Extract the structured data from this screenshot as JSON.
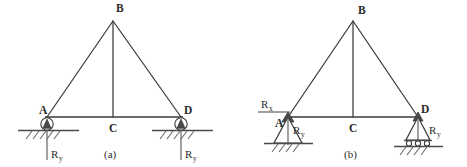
{
  "figure": {
    "background_color": "#ffffff",
    "line_color": "#3a3a3a",
    "ground_color": "#4a4a4a"
  },
  "panels": [
    {
      "id": "a",
      "caption": "(a)",
      "nodes": [
        {
          "key": "A",
          "label": "A",
          "x": 47,
          "y": 117
        },
        {
          "key": "B",
          "label": "B",
          "x": 113,
          "y": 20
        },
        {
          "key": "C",
          "label": "C",
          "x": 113,
          "y": 117
        },
        {
          "key": "D",
          "label": "D",
          "x": 181,
          "y": 117
        }
      ],
      "members": [
        {
          "from": "A",
          "to": "B"
        },
        {
          "from": "B",
          "to": "D"
        },
        {
          "from": "B",
          "to": "C"
        },
        {
          "from": "A",
          "to": "D"
        }
      ],
      "supports": [
        {
          "at": "A",
          "type": "roller-circle",
          "ground": true
        },
        {
          "at": "D",
          "type": "roller-circle",
          "ground": true
        }
      ],
      "reactions": [
        {
          "label": "R",
          "subscript": "y",
          "at": "A",
          "direction": "vertical"
        },
        {
          "label": "R",
          "subscript": "y",
          "at": "D",
          "direction": "vertical"
        }
      ]
    },
    {
      "id": "b",
      "caption": "(b)",
      "nodes": [
        {
          "key": "A",
          "label": "A",
          "x": 288,
          "y": 117
        },
        {
          "key": "B",
          "label": "B",
          "x": 353,
          "y": 20
        },
        {
          "key": "C",
          "label": "C",
          "x": 353,
          "y": 117
        },
        {
          "key": "D",
          "label": "D",
          "x": 418,
          "y": 117
        }
      ],
      "members": [
        {
          "from": "A",
          "to": "B"
        },
        {
          "from": "B",
          "to": "D"
        },
        {
          "from": "B",
          "to": "C"
        },
        {
          "from": "A",
          "to": "D"
        }
      ],
      "supports": [
        {
          "at": "A",
          "type": "pin-triangle",
          "ground": true
        },
        {
          "at": "D",
          "type": "roller-triangle",
          "ground": true
        }
      ],
      "reactions": [
        {
          "label": "R",
          "subscript": "x",
          "at": "A",
          "direction": "horizontal"
        },
        {
          "label": "R",
          "subscript": "y",
          "at": "A",
          "direction": "vertical"
        },
        {
          "label": "R",
          "subscript": "y",
          "at": "D",
          "direction": "vertical"
        }
      ]
    }
  ],
  "labels": {
    "node_a_panel_a": "A",
    "node_b_panel_a": "B",
    "node_c_panel_a": "C",
    "node_d_panel_a": "D",
    "reaction_ry_a_left": "R",
    "reaction_ry_a_left_sub": "y",
    "reaction_ry_a_right": "R",
    "reaction_ry_a_right_sub": "y",
    "caption_a": "(a)",
    "node_a_panel_b": "A",
    "node_b_panel_b": "B",
    "node_c_panel_b": "C",
    "node_d_panel_b": "D",
    "reaction_rx_b": "R",
    "reaction_rx_b_sub": "x",
    "reaction_ry_b_left": "R",
    "reaction_ry_b_left_sub": "y",
    "reaction_ry_b_right": "R",
    "reaction_ry_b_right_sub": "y",
    "caption_b": "(b)"
  }
}
